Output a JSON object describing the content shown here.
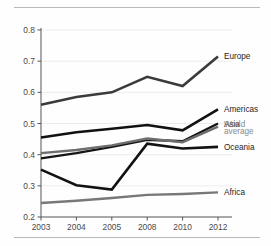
{
  "figure": {
    "background_color": "#fefefe",
    "rule_color": "#b9b9b9",
    "axis_color": "#555555",
    "grid_color": "#ededed"
  },
  "chart_data": {
    "type": "line",
    "title": "",
    "subtitle": "",
    "xlabel": "",
    "ylabel": "",
    "categories": [
      "2003",
      "2004",
      "2005",
      "2008",
      "2010",
      "2012"
    ],
    "x_tick_labels": [
      "2003",
      "2004",
      "2005",
      "2008",
      "2010",
      "2012"
    ],
    "y_tick_labels": [
      "0.2",
      "0.3",
      "0.4",
      "0.5",
      "0.6",
      "0.7",
      "0.8"
    ],
    "y_ticks": [
      0.2,
      0.3,
      0.4,
      0.5,
      0.6,
      0.7,
      0.8
    ],
    "ylim": [
      0.2,
      0.8
    ],
    "grid": true,
    "legend": "inline-right-end-labels",
    "series": [
      {
        "name": "Europe",
        "label": "Europe",
        "color": "#3b3b3b",
        "width": 2.6,
        "values": [
          0.56,
          0.585,
          0.6,
          0.65,
          0.62,
          0.715
        ]
      },
      {
        "name": "Americas",
        "label": "Americas",
        "color": "#111111",
        "width": 2.6,
        "values": [
          0.455,
          0.472,
          0.483,
          0.495,
          0.478,
          0.545
        ]
      },
      {
        "name": "Asia",
        "label": "Asia",
        "color": "#151515",
        "width": 2.4,
        "values": [
          0.388,
          0.405,
          0.425,
          0.448,
          0.443,
          0.5
        ]
      },
      {
        "name": "World average",
        "label": "World average",
        "label_line1": "World",
        "label_line2": "average",
        "color": "#6e6e6e",
        "width": 2.4,
        "muted_label": true,
        "values": [
          0.405,
          0.415,
          0.43,
          0.452,
          0.44,
          0.49
        ]
      },
      {
        "name": "Oceania",
        "label": "Oceania",
        "color": "#121212",
        "width": 2.6,
        "values": [
          0.352,
          0.302,
          0.288,
          0.435,
          0.42,
          0.425
        ]
      },
      {
        "name": "Africa",
        "label": "Africa",
        "color": "#787878",
        "width": 2.4,
        "values": [
          0.245,
          0.252,
          0.261,
          0.271,
          0.274,
          0.279
        ]
      }
    ]
  }
}
